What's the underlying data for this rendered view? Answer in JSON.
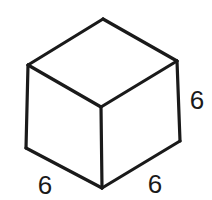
{
  "diagram": {
    "type": "isometric-cube",
    "vertices": {
      "top": [
        103,
        19
      ],
      "upper_left": [
        28,
        65
      ],
      "upper_right": [
        177,
        61
      ],
      "center": [
        101,
        107
      ],
      "lower_left": [
        26,
        148
      ],
      "lower_right": [
        180,
        141
      ],
      "bottom": [
        102,
        188
      ]
    },
    "labels": {
      "height": "6",
      "width": "6",
      "depth": "6"
    },
    "colors": {
      "stroke": "#1a1a1a",
      "background": "#ffffff"
    }
  }
}
